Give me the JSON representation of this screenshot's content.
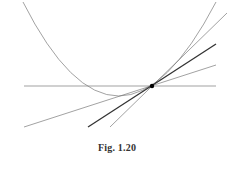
{
  "figure": {
    "caption": "Fig. 1.20"
  },
  "colors": {
    "curve": "#8a8a8a",
    "thin_line": "#7a7a7a",
    "thick_line": "#333333",
    "point": "#000000",
    "caption": "#333333",
    "background": "#ffffff"
  },
  "elements": {
    "parabola": {
      "label": "parabola",
      "vertex": [
        118,
        96
      ],
      "left_end": [
        23,
        2
      ],
      "right_end": [
        216,
        2
      ]
    },
    "horizontal_line": {
      "label": "horizontal line",
      "from": [
        24,
        86
      ],
      "to": [
        216,
        86
      ]
    },
    "shallow_line": {
      "label": "shallow secant line",
      "from": [
        24,
        127
      ],
      "to": [
        216,
        65
      ]
    },
    "thick_line": {
      "label": "tangent line (bold)",
      "from": [
        88,
        127
      ],
      "to": [
        216,
        44
      ]
    },
    "steep_line": {
      "label": "steep secant line",
      "from": [
        110,
        127
      ],
      "to": [
        227,
        13
      ]
    },
    "point": {
      "label": "point of tangency",
      "at": [
        152,
        86
      ]
    }
  }
}
